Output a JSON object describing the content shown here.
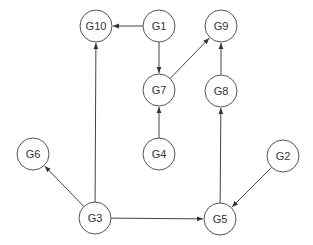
{
  "diagram": {
    "type": "directed-graph",
    "node_radius": 16,
    "colors": {
      "stroke": "#555555",
      "edge": "#444444",
      "text": "#333333",
      "fill": "#ffffff"
    },
    "nodes": [
      {
        "id": "G10",
        "label": "G10",
        "x": 96,
        "y": 26
      },
      {
        "id": "G1",
        "label": "G1",
        "x": 159,
        "y": 26
      },
      {
        "id": "G9",
        "label": "G9",
        "x": 221,
        "y": 26
      },
      {
        "id": "G7",
        "label": "G7",
        "x": 159,
        "y": 90
      },
      {
        "id": "G8",
        "label": "G8",
        "x": 221,
        "y": 91
      },
      {
        "id": "G6",
        "label": "G6",
        "x": 33,
        "y": 154
      },
      {
        "id": "G4",
        "label": "G4",
        "x": 159,
        "y": 154
      },
      {
        "id": "G2",
        "label": "G2",
        "x": 283,
        "y": 156
      },
      {
        "id": "G3",
        "label": "G3",
        "x": 95,
        "y": 218
      },
      {
        "id": "G5",
        "label": "G5",
        "x": 220,
        "y": 219
      }
    ],
    "edges": [
      {
        "from": "G1",
        "to": "G10"
      },
      {
        "from": "G1",
        "to": "G7"
      },
      {
        "from": "G7",
        "to": "G9"
      },
      {
        "from": "G8",
        "to": "G9"
      },
      {
        "from": "G4",
        "to": "G7"
      },
      {
        "from": "G3",
        "to": "G10"
      },
      {
        "from": "G3",
        "to": "G6"
      },
      {
        "from": "G3",
        "to": "G5"
      },
      {
        "from": "G5",
        "to": "G8"
      },
      {
        "from": "G2",
        "to": "G5"
      }
    ]
  }
}
